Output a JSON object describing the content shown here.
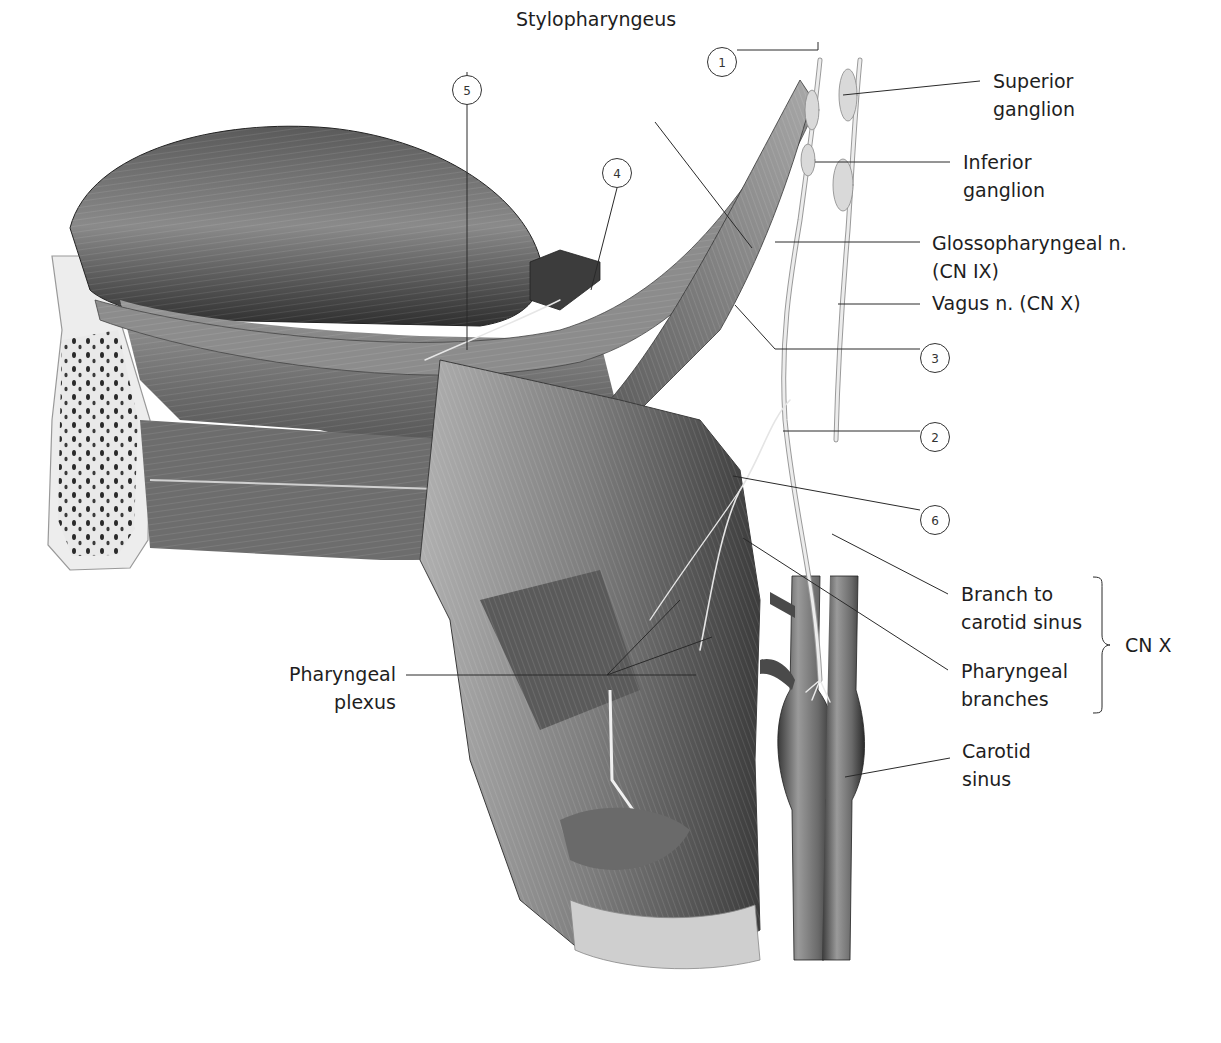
{
  "figure": {
    "palette": {
      "background": "#ffffff",
      "muscle_dark": "#3a3a3a",
      "muscle_mid": "#7a7a7a",
      "muscle_light": "#bdbdbd",
      "nerve": "#e8e8e8",
      "vessel": "#4a4a4a",
      "leader_line": "#2a2a2a"
    }
  },
  "labels": {
    "stylopharyngeus": "Stylopharyngeus",
    "superior_ganglion_1": "Superior",
    "superior_ganglion_2": "ganglion",
    "inferior_ganglion_1": "Inferior",
    "inferior_ganglion_2": "ganglion",
    "glossopharyngeal_1": "Glossopharyngeal n.",
    "glossopharyngeal_2": "(CN IX)",
    "vagus": "Vagus n. (CN X)",
    "branch_carotid_1": "Branch to",
    "branch_carotid_2": "carotid sinus",
    "pharyngeal_branches_1": "Pharyngeal",
    "pharyngeal_branches_2": "branches",
    "cn_x_group": "CN X",
    "carotid_sinus_1": "Carotid",
    "carotid_sinus_2": "sinus",
    "pharyngeal_plexus_1": "Pharyngeal",
    "pharyngeal_plexus_2": "plexus"
  },
  "callouts": [
    {
      "id": "1",
      "text": "1"
    },
    {
      "id": "2",
      "text": "2"
    },
    {
      "id": "3",
      "text": "3"
    },
    {
      "id": "4",
      "text": "4"
    },
    {
      "id": "5",
      "text": "5"
    },
    {
      "id": "6",
      "text": "6"
    }
  ]
}
